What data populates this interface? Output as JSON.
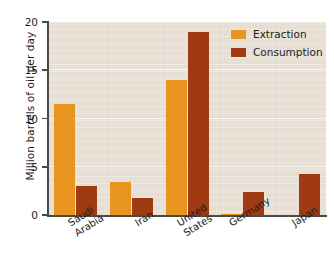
{
  "chart_data": {
    "type": "bar",
    "title": "",
    "xlabel": "",
    "ylabel": "Million barrels of oil per day",
    "ylim": [
      0,
      20
    ],
    "yticks": [
      0,
      5,
      10,
      15,
      20
    ],
    "grid": true,
    "legend_position": "top-right",
    "categories": [
      "Saudi\nArabia",
      "Iran",
      "United\nStates",
      "Germany",
      "Japan"
    ],
    "series": [
      {
        "name": "Extraction",
        "color": "#e8951f",
        "values": [
          11.5,
          3.4,
          14.0,
          0.15,
          0.05
        ]
      },
      {
        "name": "Consumption",
        "color": "#a03a12",
        "values": [
          3.0,
          1.8,
          19.0,
          2.4,
          4.3
        ]
      }
    ]
  },
  "colors": {
    "plot_background": "#e7dfd3",
    "page_background": "#ffffff",
    "axis": "#4a4a48",
    "text": "#1d1d1b",
    "extraction": "#e8951f",
    "consumption": "#a03a12"
  }
}
